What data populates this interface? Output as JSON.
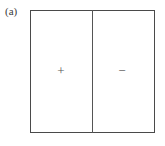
{
  "figure": {
    "panel_label": "(a)",
    "width": 165,
    "height": 146,
    "background_color": "#ffffff",
    "border_color": "#4a4a4a",
    "divider_color": "#555555",
    "sign_color": "#555555"
  },
  "diagram": {
    "type": "parallel-plate-capacitor-schematic",
    "outer_box": {
      "x": 30,
      "y": 10,
      "width": 125,
      "height": 123
    },
    "divider": {
      "x": 92,
      "orientation": "vertical"
    },
    "regions": [
      {
        "name": "left-region",
        "sign": "+",
        "sign_name": "plus-sign"
      },
      {
        "name": "right-region",
        "sign": "−",
        "sign_name": "minus-sign"
      }
    ]
  }
}
